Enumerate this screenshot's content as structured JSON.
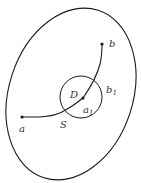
{
  "diagram": {
    "colors": {
      "stroke": "#1a1a1a",
      "label": "#333333",
      "background": "#ffffff"
    },
    "labels": {
      "a": "a",
      "a1_main": "a",
      "a1_sub": "1",
      "b": "b",
      "b1_main": "b",
      "b1_sub": "1",
      "D": "D",
      "S": "S"
    },
    "points": [
      {
        "name": "a",
        "x": 22,
        "y": 117
      },
      {
        "name": "a1",
        "x": 83,
        "y": 98
      },
      {
        "name": "b",
        "x": 102,
        "y": 44
      }
    ],
    "shapes": {
      "outer_region": {
        "type": "ellipse",
        "cx": 71,
        "cy": 94,
        "rx": 62,
        "ry": 88,
        "rotate": 18
      },
      "disc_D": {
        "type": "circle",
        "cx": 81,
        "cy": 97,
        "r": 21
      }
    }
  }
}
